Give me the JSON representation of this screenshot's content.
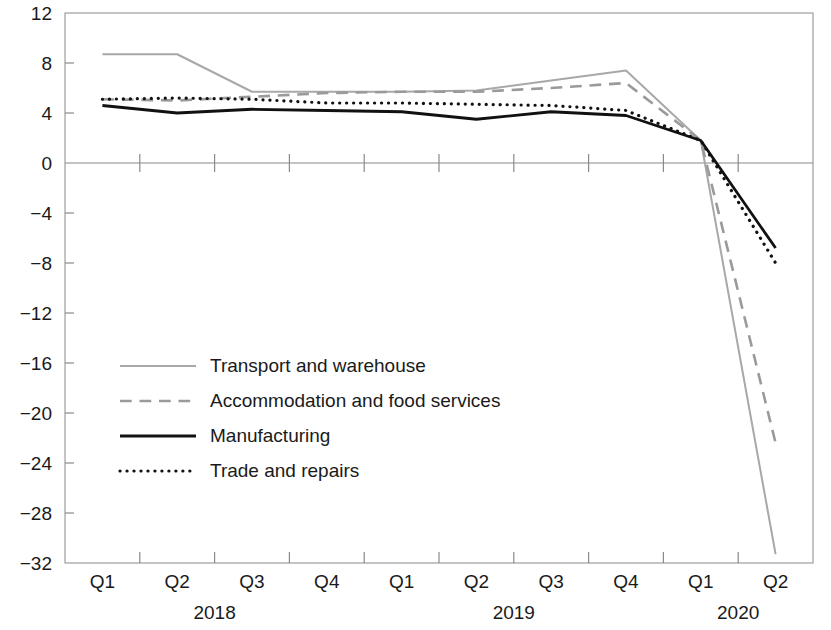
{
  "chart_data": {
    "type": "line",
    "title": "",
    "xlabel": "",
    "ylabel": "",
    "ylim": [
      -32,
      12
    ],
    "grid": false,
    "legend_position": "inside-left",
    "x": [
      "Q1",
      "Q2",
      "Q3",
      "Q4",
      "Q1",
      "Q2",
      "Q3",
      "Q4",
      "Q1",
      "Q2"
    ],
    "x_groups": [
      {
        "label": "2018",
        "quarters": [
          "Q1",
          "Q2",
          "Q3",
          "Q4"
        ]
      },
      {
        "label": "2019",
        "quarters": [
          "Q1",
          "Q2",
          "Q3",
          "Q4"
        ]
      },
      {
        "label": "2020",
        "quarters": [
          "Q1",
          "Q2"
        ]
      }
    ],
    "y_ticks": [
      12,
      8,
      4,
      0,
      -4,
      -8,
      -12,
      -16,
      -20,
      -24,
      -28,
      -32
    ],
    "y_tick_labels": [
      "12",
      "8",
      "4",
      "0",
      "−4",
      "−8",
      "−12",
      "−16",
      "−20",
      "−24",
      "−28",
      "−32"
    ],
    "series": [
      {
        "name": "Transport and warehouse",
        "style": "solid",
        "color": "#a8a8a8",
        "width": 2.0,
        "values": [
          8.7,
          8.7,
          5.7,
          5.7,
          5.7,
          5.8,
          6.6,
          7.4,
          1.8,
          -31.3
        ]
      },
      {
        "name": "Accommodation and food services",
        "style": "dashed",
        "color": "#9a9a9a",
        "width": 2.6,
        "values": [
          5.1,
          5.0,
          5.3,
          5.6,
          5.7,
          5.7,
          6.0,
          6.4,
          1.8,
          -22.4
        ]
      },
      {
        "name": "Manufacturing",
        "style": "solid",
        "color": "#111111",
        "width": 2.8,
        "values": [
          4.6,
          4.0,
          4.3,
          4.2,
          4.1,
          3.5,
          4.1,
          3.8,
          1.8,
          -6.8
        ]
      },
      {
        "name": "Trade and repairs",
        "style": "dotted",
        "color": "#111111",
        "width": 3.2,
        "values": [
          5.1,
          5.2,
          5.1,
          4.8,
          4.8,
          4.7,
          4.6,
          4.2,
          1.8,
          -8.0
        ]
      }
    ]
  },
  "legend": {
    "items": [
      {
        "label": "Transport and warehouse"
      },
      {
        "label": "Accommodation and food services"
      },
      {
        "label": "Manufacturing"
      },
      {
        "label": "Trade and repairs"
      }
    ]
  },
  "axis": {
    "y_labels": [
      "12",
      "8",
      "4",
      "0",
      "−4",
      "−8",
      "−12",
      "−16",
      "−20",
      "−24",
      "−28",
      "−32"
    ],
    "x_labels": [
      "Q1",
      "Q2",
      "Q3",
      "Q4",
      "Q1",
      "Q2",
      "Q3",
      "Q4",
      "Q1",
      "Q2"
    ],
    "year_labels": [
      "2018",
      "2019",
      "2020"
    ]
  }
}
